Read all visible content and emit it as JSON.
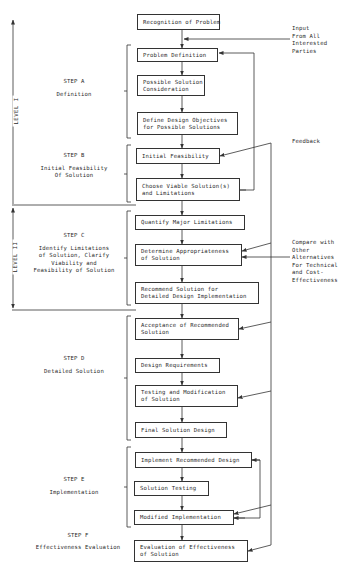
{
  "diagram": {
    "levels": [
      {
        "id": "level-1",
        "label": "LEVEL I"
      },
      {
        "id": "level-2",
        "label": "LEVEL II"
      }
    ],
    "steps": [
      {
        "id": "A",
        "title": "STEP A",
        "subtitle": [
          "Definition"
        ]
      },
      {
        "id": "B",
        "title": "STEP B",
        "subtitle": [
          "Initial Feasibility",
          "Of Solution"
        ]
      },
      {
        "id": "C",
        "title": "STEP C",
        "subtitle": [
          "Identify Limitations",
          "of Solution, Clarify",
          "Viability and",
          "Feasibility of Solution"
        ]
      },
      {
        "id": "D",
        "title": "STEP D",
        "subtitle": [
          "Detailed Solution"
        ]
      },
      {
        "id": "E",
        "title": "STEP E",
        "subtitle": [
          "Implementation"
        ]
      },
      {
        "id": "F",
        "title": "STEP F",
        "subtitle": [
          "Effectiveness Evaluation"
        ]
      }
    ],
    "boxes": [
      {
        "id": "recognition",
        "lines": [
          "Recognition of Problem"
        ]
      },
      {
        "id": "problem-definition",
        "lines": [
          "Problem Definition"
        ]
      },
      {
        "id": "possible-solution",
        "lines": [
          "Possible Solution",
          "Consideration"
        ]
      },
      {
        "id": "define-objectives",
        "lines": [
          "Define Design Objectives",
          "for Possible Solutions"
        ]
      },
      {
        "id": "initial-feasibility",
        "lines": [
          "Initial Feasibility"
        ]
      },
      {
        "id": "choose-viable",
        "lines": [
          "Choose Viable Solution(s)",
          "and Limitations"
        ]
      },
      {
        "id": "quantify-limitations",
        "lines": [
          "Quantify Major Limitations"
        ]
      },
      {
        "id": "determine-appropriateness",
        "lines": [
          "Determine Appropriateness",
          "of Solution"
        ]
      },
      {
        "id": "recommend-solution",
        "lines": [
          "Recommend Solution for",
          "Detailed Design Implementation"
        ]
      },
      {
        "id": "acceptance",
        "lines": [
          "Acceptance of Recommended",
          "Solution"
        ]
      },
      {
        "id": "design-requirements",
        "lines": [
          "Design Requirements"
        ]
      },
      {
        "id": "testing-modification",
        "lines": [
          "Testing and Modification",
          "of Solution"
        ]
      },
      {
        "id": "final-design",
        "lines": [
          "Final Solution Design"
        ]
      },
      {
        "id": "implement-design",
        "lines": [
          "Implement Recommended Design"
        ]
      },
      {
        "id": "solution-testing",
        "lines": [
          "Solution Testing"
        ]
      },
      {
        "id": "modified-implementation",
        "lines": [
          "Modified Implementation"
        ]
      },
      {
        "id": "evaluation",
        "lines": [
          "Evaluation of Effectiveness",
          "of Solution"
        ]
      }
    ],
    "annotations": {
      "input": [
        "Input",
        "From All",
        "Interested",
        "Parties"
      ],
      "feedback": [
        "Feedback"
      ],
      "compare": [
        "Compare with",
        "Other",
        "Alternatives",
        "For Technical",
        "and Cost-",
        "Effectiveness"
      ]
    }
  }
}
